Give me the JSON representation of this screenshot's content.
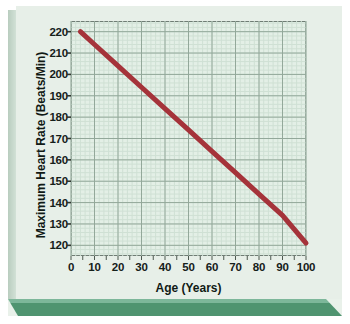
{
  "figure": {
    "background_color": "#e7efe8",
    "plot_background_color": "#e3efe6",
    "base_color": "#4f9470",
    "frame_color": "#6f7c74"
  },
  "chart_data": {
    "type": "line",
    "title": "",
    "xlabel": "Age (Years)",
    "ylabel": "Maximum Heart Rate (Beats/Min)",
    "xlim": [
      0,
      100
    ],
    "ylim": [
      115,
      225
    ],
    "xticks": [
      0,
      10,
      20,
      30,
      40,
      50,
      60,
      70,
      80,
      90,
      100
    ],
    "yticks": [
      120,
      130,
      140,
      150,
      160,
      170,
      180,
      190,
      200,
      210,
      220
    ],
    "xtick_labels": [
      "0",
      "10",
      "20",
      "30",
      "40",
      "50",
      "60",
      "70",
      "80",
      "90",
      "100"
    ],
    "ytick_labels": [
      "120",
      "130",
      "140",
      "150",
      "160",
      "170",
      "180",
      "190",
      "200",
      "210",
      "220"
    ],
    "grid": true,
    "minor_grid": true,
    "minor_grid_divisions": 5,
    "legend": false,
    "legend_position": "none",
    "series": [
      {
        "name": "Maximum Heart Rate",
        "color": "#a5333a",
        "line_width": 5,
        "x": [
          4,
          10,
          20,
          30,
          40,
          50,
          60,
          70,
          80,
          90,
          100
        ],
        "values": [
          220,
          214,
          204,
          194,
          184,
          174,
          164,
          154,
          144,
          134,
          121
        ]
      }
    ],
    "annotations": []
  }
}
